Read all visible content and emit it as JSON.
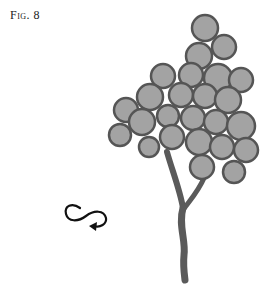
{
  "figure": {
    "label": "Fig. 8"
  },
  "illustration": {
    "subject": "grape-like cluster of circles on a forked stem",
    "circle_fill": "#a3a3a3",
    "circle_stroke": "#555555",
    "stem_color": "#5a5a5a",
    "circles": [
      [
        205,
        28,
        13
      ],
      [
        224,
        47,
        12
      ],
      [
        199,
        56,
        13
      ],
      [
        163,
        76,
        12
      ],
      [
        191,
        75,
        12
      ],
      [
        218,
        78,
        14
      ],
      [
        241,
        80,
        12
      ],
      [
        150,
        97,
        13
      ],
      [
        181,
        95,
        12
      ],
      [
        205,
        96,
        12
      ],
      [
        228,
        100,
        13
      ],
      [
        126,
        110,
        12
      ],
      [
        142,
        122,
        13
      ],
      [
        168,
        116,
        11
      ],
      [
        193,
        118,
        12
      ],
      [
        216,
        122,
        12
      ],
      [
        241,
        126,
        14
      ],
      [
        120,
        135,
        11
      ],
      [
        149,
        147,
        10
      ],
      [
        172,
        137,
        12
      ],
      [
        199,
        142,
        13
      ],
      [
        222,
        147,
        12
      ],
      [
        246,
        150,
        12
      ],
      [
        202,
        167,
        12
      ],
      [
        234,
        172,
        11
      ]
    ]
  },
  "symbol": {
    "name": "loop-arrow-icon"
  }
}
